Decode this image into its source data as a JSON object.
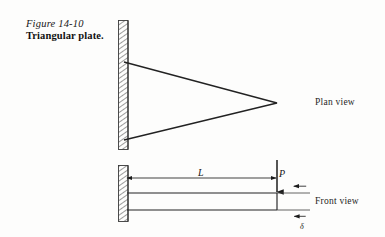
{
  "figure": {
    "number": "Figure 14-10",
    "title": "Triangular plate.",
    "colors": {
      "ink": "#1a1a1a",
      "line": "#222222",
      "hatch": "#555555",
      "background": "#fdfdfc"
    }
  },
  "views": {
    "plan": {
      "label": "Plan view",
      "shape": "triangle",
      "description": "Triangular plate cantilevered from a fixed wall, apex pointing right",
      "wall": {
        "x": 118,
        "y": 20,
        "width": 10,
        "height": 130,
        "hatch": "diagonal"
      },
      "triangle_vertices": [
        [
          124,
          62
        ],
        [
          124,
          140
        ],
        [
          277,
          103
        ]
      ]
    },
    "front": {
      "label": "Front view",
      "description": "Side elevation of the plate as a cantilever beam with tip load",
      "wall": {
        "x": 118,
        "y": 165,
        "width": 10,
        "height": 57,
        "hatch": "diagonal"
      },
      "beam_top_y": 193,
      "beam_bottom_y": 210,
      "beam_start_x": 126,
      "beam_end_x": 277,
      "extension_end_x": 307
    }
  },
  "annotations": {
    "length": {
      "label": "L",
      "name": "span-length",
      "dimension_line_y": 178,
      "from_x": 126,
      "to_x": 277,
      "arrowheads": "both"
    },
    "load": {
      "label": "P",
      "name": "tip-load",
      "x": 277,
      "from_y": 160,
      "to_y": 193,
      "direction": "down"
    },
    "deflection": {
      "label": "δ",
      "name": "tip-deflection",
      "x": 300,
      "from_y": 193,
      "to_y": 222,
      "arrowheads": "both"
    }
  }
}
